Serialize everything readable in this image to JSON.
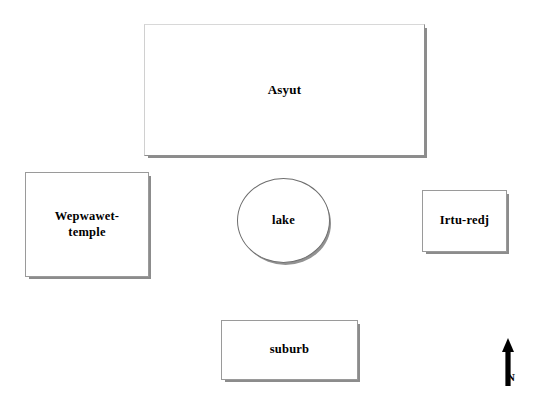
{
  "map": {
    "title": "Asyut city plan sketch",
    "background_color": "#ffffff",
    "outline_color": "#9a9a9a",
    "label_color": "#000000",
    "zones": [
      {
        "id": "asyut",
        "label": "Asyut",
        "shape": "rectangle"
      },
      {
        "id": "wepwawet",
        "label": "Wepwawet-\ntemple",
        "shape": "rectangle"
      },
      {
        "id": "lake",
        "label": "lake",
        "shape": "ellipse"
      },
      {
        "id": "irturedj",
        "label": "Irtu-redj",
        "shape": "rectangle"
      },
      {
        "id": "suburb",
        "label": "suburb",
        "shape": "rectangle"
      }
    ],
    "compass": {
      "icon": "north-arrow-icon",
      "label": "N",
      "direction": "up"
    }
  }
}
